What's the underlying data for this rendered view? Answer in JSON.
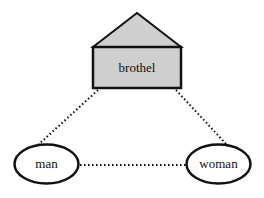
{
  "diagram": {
    "nodes": {
      "brothel": {
        "label": "brothel",
        "shape": "house",
        "fill": "#cfcfcf"
      },
      "man": {
        "label": "man",
        "shape": "ellipse",
        "fill": "#ffffff"
      },
      "woman": {
        "label": "woman",
        "shape": "ellipse",
        "fill": "#ffffff"
      }
    },
    "edges": [
      {
        "from": "brothel",
        "to": "man",
        "style": "dotted"
      },
      {
        "from": "brothel",
        "to": "woman",
        "style": "dotted"
      },
      {
        "from": "man",
        "to": "woman",
        "style": "dotted"
      }
    ],
    "colors": {
      "stroke": "#111111",
      "house_fill": "#cfcfcf"
    }
  }
}
